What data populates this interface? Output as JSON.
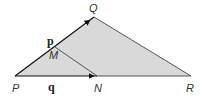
{
  "diagram": {
    "shading_color": "#d9d9d9",
    "line_color": "#555555",
    "vector_color": "#111111",
    "points": {
      "P": {
        "label": "P",
        "x": 15,
        "y": 76
      },
      "Q": {
        "label": "Q",
        "x": 94,
        "y": 17
      },
      "R": {
        "label": "R",
        "x": 191,
        "y": 76
      },
      "N": {
        "label": "N",
        "x": 97,
        "y": 76
      },
      "M": {
        "label": "M",
        "x": 55,
        "y": 47
      }
    },
    "vectors": {
      "p": {
        "label": "p",
        "from": "P",
        "to": "Q"
      },
      "q": {
        "label": "q",
        "from": "P",
        "to": "N"
      }
    },
    "segments": [
      {
        "from": "Q",
        "to": "R"
      },
      {
        "from": "N",
        "to": "R"
      },
      {
        "from": "M",
        "to": "N"
      }
    ]
  }
}
